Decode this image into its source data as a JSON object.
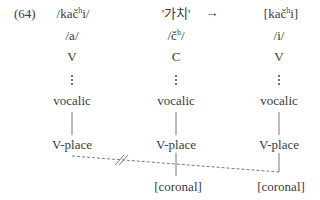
{
  "example_number": "(64)",
  "arrow": "→",
  "columns": [
    {
      "header_pre": "/kač",
      "header_sup": "h",
      "header_post": "i/",
      "segment": "/a/",
      "root": "V",
      "node1": "vocalic",
      "node2": "V-place",
      "terminal": ""
    },
    {
      "header": "'가치'",
      "segment_pre": "/č",
      "segment_sup": "h",
      "segment_post": "/",
      "root": "C",
      "node1": "vocalic",
      "node2": "V-place",
      "terminal": "[coronal]"
    },
    {
      "header_pre": "[kač",
      "header_sup": "h",
      "header_post": "i]",
      "segment": "/i/",
      "root": "V",
      "node1": "vocalic",
      "node2": "V-place",
      "terminal": "[coronal]"
    }
  ],
  "annotations": {
    "delink_mark": "//",
    "spread_line": "dashed association from V-place of /a/ to [coronal] of /i/, blocked (delinked) by crossing"
  },
  "colors": {
    "text": "#3a3a3a",
    "lines": "#6a6a6a"
  }
}
